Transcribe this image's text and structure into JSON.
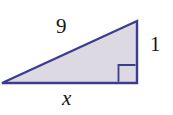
{
  "figure": {
    "kind": "right-triangle-diagram",
    "background_color": "#ffffff",
    "fill_color": "#dcd9e3",
    "stroke_color": "#3d3d8f",
    "label_color": "#161616",
    "labels": {
      "hypotenuse": "9",
      "vertical_leg": "1",
      "base": "x"
    },
    "right_angle_marker": {
      "name": "right-angle-square",
      "present": true,
      "corner": "bottom-right"
    },
    "geometry": {
      "vertex_left": "2,83",
      "vertex_bottom_right": "137,83",
      "vertex_top_right": "137,21",
      "points": "2,83 137,83 137,21"
    }
  }
}
